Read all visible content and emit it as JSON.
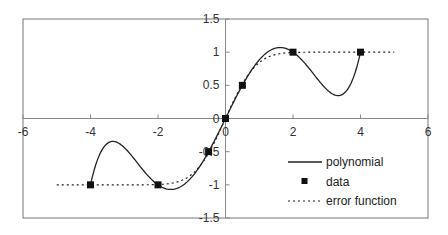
{
  "chart_data": {
    "type": "line",
    "title": "",
    "xlabel": "",
    "ylabel": "",
    "xlim": [
      -6,
      6
    ],
    "ylim": [
      -1.5,
      1.5
    ],
    "grid": false,
    "legend_position": "lower right (inside plot)",
    "x_ticks": [
      -6,
      -4,
      -2,
      0,
      2,
      4,
      6
    ],
    "x_tick_labels": [
      "-6",
      "-4",
      "-2",
      "0",
      "2",
      "4",
      "6"
    ],
    "y_ticks": [
      1.5,
      1,
      0.5,
      0,
      -0.5,
      -1,
      -1.5
    ],
    "y_tick_labels": [
      "1.5",
      "1",
      "0.5",
      "0",
      "-0.5",
      "-1",
      "-1.5"
    ],
    "series": [
      {
        "name": "polynomial",
        "style": "solid line",
        "description": "interpolating polynomial through the data points, domain [-4, 4]",
        "x": [
          -4,
          -3.4,
          -2,
          -1.4,
          0,
          1.4,
          2,
          3.4,
          4
        ],
        "y": [
          -1,
          -0.2,
          -1,
          -1.07,
          0,
          1.07,
          1,
          0.2,
          1
        ]
      },
      {
        "name": "data",
        "style": "square markers",
        "x": [
          -4,
          -2,
          -0.5,
          0,
          0.5,
          2,
          4
        ],
        "y": [
          -1,
          -1,
          -0.5,
          0,
          0.5,
          1,
          1
        ]
      },
      {
        "name": "error function",
        "style": "dotted line",
        "description": "erf(x) over [-5, 5]",
        "x": [
          -5,
          -3,
          -2,
          -1,
          -0.5,
          0,
          0.5,
          1,
          2,
          3,
          5
        ],
        "y": [
          -1,
          -1,
          -0.995,
          -0.843,
          -0.52,
          0,
          0.52,
          0.843,
          0.995,
          1,
          1
        ]
      }
    ],
    "legend": [
      "polynomial",
      "data",
      "error function"
    ]
  },
  "colors": {
    "line": "#222222",
    "axis": "#888888",
    "frame": "#777777",
    "marker": "#111111",
    "background": "#ffffff"
  }
}
